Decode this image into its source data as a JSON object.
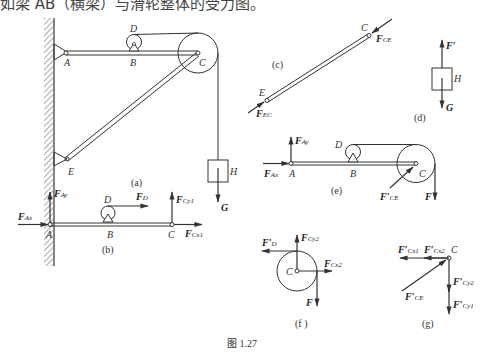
{
  "top_text": "如梁 AB（横梁）与滑轮整体的受力图。",
  "figure_caption": "图 1.27",
  "panels": {
    "a": {
      "caption": "(a)",
      "labels": {
        "A": "A",
        "B": "B",
        "C": "C",
        "D": "D",
        "E": "E",
        "H": "H",
        "G": "G"
      }
    },
    "b": {
      "caption": "(b)",
      "labels": {
        "A": "A",
        "B": "B",
        "C": "C",
        "D": "D"
      },
      "forces": {
        "FAx": [
          "F",
          "Ax"
        ],
        "FAy": [
          "F",
          "Ay"
        ],
        "FD": [
          "F",
          "D"
        ],
        "FCy1": [
          "F",
          "Cy1"
        ],
        "FCx1": [
          "F",
          "Cx1"
        ]
      }
    },
    "c": {
      "caption": "(c)",
      "labels": {
        "C": "C",
        "E": "E"
      },
      "forces": {
        "FCE": [
          "F",
          "CE"
        ],
        "FEC": [
          "F",
          "EC"
        ]
      }
    },
    "d": {
      "caption": "(d)",
      "labels": {
        "H": "H"
      },
      "forces": {
        "Fp": [
          "F′",
          ""
        ],
        "G": [
          "G",
          ""
        ]
      }
    },
    "e": {
      "caption": "(e)",
      "labels": {
        "A": "A",
        "B": "B",
        "C": "C",
        "D": "D"
      },
      "forces": {
        "FAx": [
          "F",
          "Ax"
        ],
        "FAy": [
          "F",
          "Ay"
        ],
        "FCEp": [
          "F′",
          "CE"
        ],
        "F": [
          "F",
          ""
        ]
      }
    },
    "f": {
      "caption": "(f )",
      "labels": {
        "C": "C"
      },
      "forces": {
        "FDp": [
          "F′",
          "D"
        ],
        "FCy2": [
          "F",
          "Cy2"
        ],
        "FCx2": [
          "F",
          "Cx2"
        ],
        "F": [
          "F",
          ""
        ]
      }
    },
    "g": {
      "caption": "(g)",
      "labels": {
        "C": "C"
      },
      "forces": {
        "FCx1p": [
          "F′",
          "Cx1"
        ],
        "FCx2p": [
          "F′",
          "Cx2"
        ],
        "FCy2p": [
          "F′",
          "Cy2"
        ],
        "FCy1p": [
          "F′",
          "Cy1"
        ],
        "FCEp": [
          "F′",
          "CE"
        ]
      }
    }
  }
}
